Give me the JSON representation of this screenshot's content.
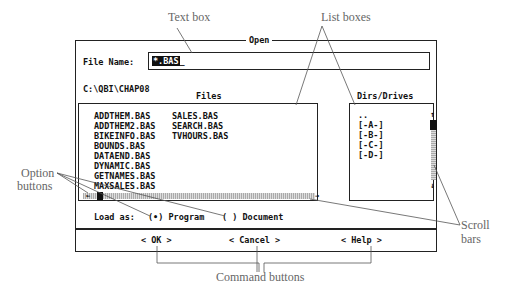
{
  "annotations": {
    "text_box": "Text box",
    "list_boxes": "List boxes",
    "option_buttons_line1": "Option",
    "option_buttons_line2": "buttons",
    "scroll_bars_line1": "Scroll",
    "scroll_bars_line2": "bars",
    "command_buttons": "Command buttons"
  },
  "dialog": {
    "title": "Open",
    "file_name_label": "File Name:",
    "file_name_value": "*.BAS",
    "path": "C:\\QBI\\CHAP08",
    "files_header": "Files",
    "dirs_header": "Dirs/Drives",
    "files": {
      "col1": [
        "ADDTHEM.BAS",
        "ADDTHEM2.BAS",
        "BIKEINFO.BAS",
        "BOUNDS.BAS",
        "DATAEND.BAS",
        "DYNAMIC.BAS",
        "GETNAMES.BAS",
        "MAXSALES.BAS"
      ],
      "col2": [
        "SALES.BAS",
        "SEARCH.BAS",
        "TVHOURS.BAS"
      ]
    },
    "dirs": [
      "..",
      "[-A-]",
      "[-B-]",
      "[-C-]",
      "[-D-]"
    ],
    "load_as_label": "Load as:",
    "options": [
      {
        "label": "(•) Program",
        "selected": true
      },
      {
        "label": "( ) Document",
        "selected": false
      }
    ],
    "buttons": {
      "ok": "< OK >",
      "cancel": "< Cancel >",
      "help": "< Help >"
    },
    "scroll_arrows": {
      "left": "←",
      "right": "→",
      "up": "↑",
      "down": "↓"
    }
  }
}
